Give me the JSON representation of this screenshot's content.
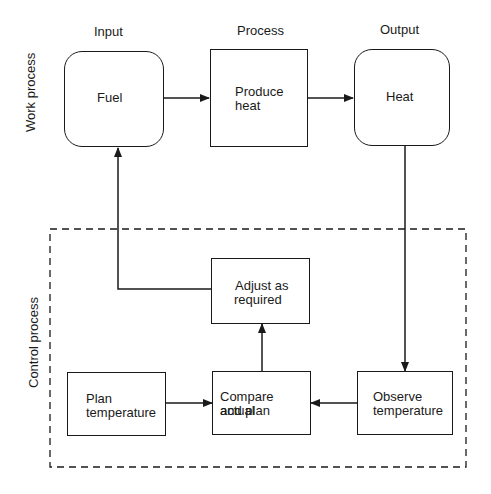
{
  "column_headers": {
    "input": "Input",
    "process": "Process",
    "output": "Output"
  },
  "row_labels": {
    "work": "Work process",
    "control": "Control process"
  },
  "nodes": {
    "fuel": "Fuel",
    "produce_heat": [
      "Produce",
      "heat"
    ],
    "heat": "Heat",
    "adjust": [
      "Adjust as",
      "required"
    ],
    "plan": [
      "Plan",
      "temperature"
    ],
    "compare": [
      "Compare actual",
      "and plan"
    ],
    "observe": [
      "Observe",
      "temperature"
    ]
  },
  "edges": [
    {
      "from": "fuel",
      "to": "produce_heat"
    },
    {
      "from": "produce_heat",
      "to": "heat"
    },
    {
      "from": "heat",
      "to": "observe"
    },
    {
      "from": "observe",
      "to": "compare"
    },
    {
      "from": "plan",
      "to": "compare"
    },
    {
      "from": "compare",
      "to": "adjust"
    },
    {
      "from": "adjust",
      "to": "fuel"
    }
  ],
  "colors": {
    "stroke": "#1a1a1a",
    "background": "#ffffff"
  }
}
